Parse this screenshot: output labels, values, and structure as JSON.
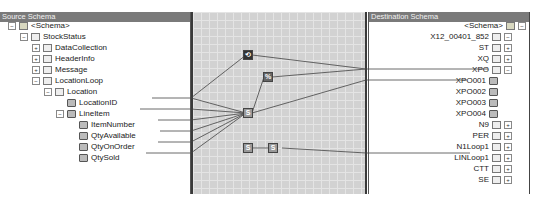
{
  "source": {
    "title": "Source Schema",
    "nodes": [
      {
        "label": "<Schema>",
        "expander": "−",
        "icon": "folder"
      },
      {
        "label": "StockStatus",
        "expander": "−",
        "icon": "record"
      },
      {
        "label": "DataCollection",
        "expander": "+",
        "icon": "record"
      },
      {
        "label": "HeaderInfo",
        "expander": "+",
        "icon": "record"
      },
      {
        "label": "Message",
        "expander": "+",
        "icon": "record"
      },
      {
        "label": "LocationLoop",
        "expander": "−",
        "icon": "record"
      },
      {
        "label": "Location",
        "expander": "−",
        "icon": "record"
      },
      {
        "label": "LocationID",
        "expander": "",
        "icon": "field"
      },
      {
        "label": "LineItem",
        "expander": "−",
        "icon": "field"
      },
      {
        "label": "ItemNumber",
        "expander": "",
        "icon": "field"
      },
      {
        "label": "QtyAvailable",
        "expander": "",
        "icon": "field"
      },
      {
        "label": "QtyOnOrder",
        "expander": "",
        "icon": "field"
      },
      {
        "label": "QtySold",
        "expander": "",
        "icon": "field"
      }
    ]
  },
  "destination": {
    "title": "Destination Schema",
    "nodes": [
      {
        "label": "<Schema>",
        "expander": "−",
        "icon": "folder"
      },
      {
        "label": "X12_00401_852",
        "expander": "−",
        "icon": "record"
      },
      {
        "label": "ST",
        "expander": "+",
        "icon": "record"
      },
      {
        "label": "XQ",
        "expander": "+",
        "icon": "record"
      },
      {
        "label": "XPO",
        "expander": "−",
        "icon": "record"
      },
      {
        "label": "XPO001",
        "expander": "",
        "icon": "field"
      },
      {
        "label": "XPO002",
        "expander": "",
        "icon": "field"
      },
      {
        "label": "XPO003",
        "expander": "",
        "icon": "field"
      },
      {
        "label": "XPO004",
        "expander": "",
        "icon": "field"
      },
      {
        "label": "N9",
        "expander": "+",
        "icon": "record"
      },
      {
        "label": "PER",
        "expander": "+",
        "icon": "record"
      },
      {
        "label": "N1Loop1",
        "expander": "+",
        "icon": "record"
      },
      {
        "label": "LINLoop1",
        "expander": "+",
        "icon": "record"
      },
      {
        "label": "CTT",
        "expander": "+",
        "icon": "record"
      },
      {
        "label": "SE",
        "expander": "+",
        "icon": "record"
      }
    ]
  },
  "grid": {
    "functoids": [
      {
        "name": "string-functoid-1",
        "glyph": "⟲"
      },
      {
        "name": "string-functoid-2",
        "glyph": "%"
      },
      {
        "name": "scripting-functoid-1",
        "glyph": "S"
      },
      {
        "name": "scripting-functoid-2",
        "glyph": "S"
      },
      {
        "name": "scripting-functoid-3",
        "glyph": "S"
      }
    ]
  },
  "colors": {
    "header_bg": "#7a7a7a",
    "grid_bg": "#d2d2d2",
    "link": "#444444"
  }
}
